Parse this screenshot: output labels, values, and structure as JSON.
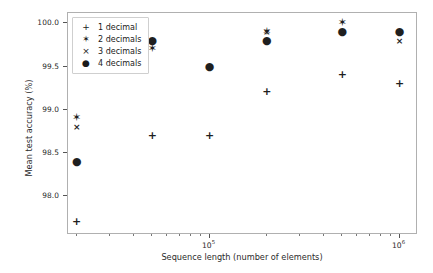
{
  "chart_data": {
    "type": "scatter",
    "title": "",
    "xlabel": "Sequence length (number of elements)",
    "ylabel": "Mean test accuracy (%)",
    "xscale": "log",
    "yscale": "linear",
    "xlim": [
      18000,
      1250000
    ],
    "ylim": [
      97.55,
      100.12
    ],
    "grid": false,
    "legend_position": "upper left",
    "xticks": [
      "10⁵",
      "10⁶"
    ],
    "xtick_values": [
      100000,
      1000000
    ],
    "yticks": [
      "98.0",
      "98.5",
      "99.0",
      "99.5",
      "100.0"
    ],
    "ytick_values": [
      98.0,
      98.5,
      99.0,
      99.5,
      100.0
    ],
    "series": [
      {
        "name": "1 decimal",
        "marker": "plus",
        "marker_glyph": "+",
        "color": "#1f1f1f",
        "x": [
          20000,
          50000,
          100000,
          200000,
          500000,
          1000000
        ],
        "y": [
          97.7,
          98.7,
          98.7,
          99.2,
          99.4,
          99.3
        ]
      },
      {
        "name": "2 decimals",
        "marker": "star",
        "marker_glyph": "✶",
        "color": "#1f1f1f",
        "x": [
          20000,
          50000,
          200000,
          500000
        ],
        "y": [
          98.9,
          99.7,
          99.9,
          100.0
        ]
      },
      {
        "name": "3 decimals",
        "marker": "x",
        "marker_glyph": "×",
        "color": "#1f1f1f",
        "x": [
          20000,
          200000,
          1000000
        ],
        "y": [
          98.8,
          99.9,
          99.8
        ]
      },
      {
        "name": "4 decimals",
        "marker": "circle",
        "marker_glyph": "●",
        "color": "#1f1f1f",
        "x": [
          20000,
          50000,
          100000,
          200000,
          500000,
          1000000
        ],
        "y": [
          98.4,
          99.8,
          99.5,
          99.8,
          99.9,
          99.9
        ]
      }
    ]
  },
  "legend": {
    "items": [
      {
        "marker": "+",
        "label": "1 decimal"
      },
      {
        "marker": "✶",
        "label": "2 decimals"
      },
      {
        "marker": "×",
        "label": "3 decimals"
      },
      {
        "marker": "●",
        "label": "4 decimals"
      }
    ]
  },
  "axes": {
    "x_title": "Sequence length (number of elements)",
    "y_title": "Mean test accuracy (%)",
    "y_tick_labels": [
      "100.0",
      "99.5",
      "99.0",
      "98.5",
      "98.0"
    ],
    "x_tick_labels": [
      "10",
      "10"
    ],
    "x_tick_exponents": [
      "5",
      "6"
    ]
  }
}
